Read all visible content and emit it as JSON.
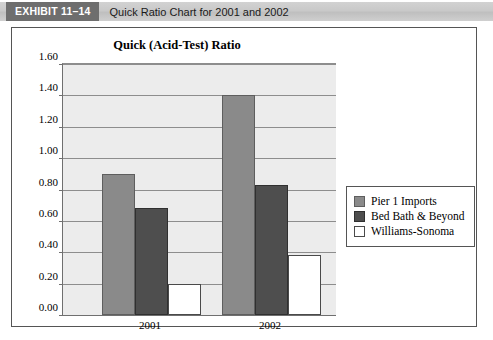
{
  "header": {
    "exhibit_tag": "EXHIBIT 11–14",
    "exhibit_title": "Quick Ratio Chart for 2001 and 2002"
  },
  "chart_data": {
    "type": "bar",
    "title": "Quick (Acid-Test) Ratio",
    "xlabel": "",
    "ylabel": "",
    "categories": [
      "2001",
      "2002"
    ],
    "series": [
      {
        "name": "Pier 1 Imports",
        "color": "#8a8a8a",
        "values": [
          0.9,
          1.4
        ]
      },
      {
        "name": "Bed Bath & Beyond",
        "color": "#4e4e4e",
        "values": [
          0.68,
          0.83
        ]
      },
      {
        "name": "Williams-Sonoma",
        "color": "#ffffff",
        "values": [
          0.2,
          0.38
        ]
      }
    ],
    "ylim": [
      0.0,
      1.6
    ],
    "ytick_labels": [
      "0.00",
      "0.20",
      "0.40",
      "0.60",
      "0.80",
      "1.00",
      "1.20",
      "1.40",
      "1.60"
    ],
    "ytick_values": [
      0.0,
      0.2,
      0.4,
      0.6,
      0.8,
      1.0,
      1.2,
      1.4,
      1.6
    ],
    "grid": true,
    "legend_position": "right"
  }
}
